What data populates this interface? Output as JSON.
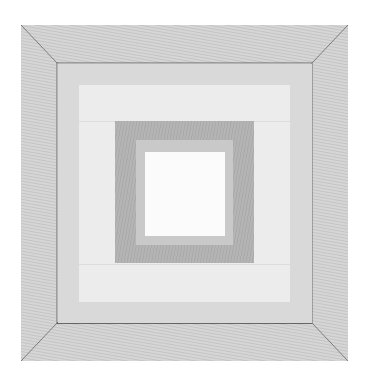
{
  "artwork": {
    "description": "Nested square quilt-block pattern with beveled outer frame",
    "colors": {
      "background": "#ffffff",
      "outer_frame": "#d4d4d4",
      "frame_edge_line": "#7a7a7a",
      "inner_band": "#d9d9d9",
      "light_panel": "#ececec",
      "dark_square": "#b4b4b4",
      "mid_ring": "#c8c8c8",
      "center": "#fbfbfb"
    },
    "geometry": {
      "outer": [
        21,
        25,
        348,
        361
      ],
      "inner_frame": [
        57,
        63,
        312,
        323
      ],
      "light_panel": [
        79,
        85,
        290,
        302
      ],
      "dark_square": [
        115,
        121,
        254,
        263
      ],
      "mid_ring": [
        136,
        139,
        233,
        246
      ],
      "center": [
        145,
        152,
        225,
        236
      ]
    }
  }
}
